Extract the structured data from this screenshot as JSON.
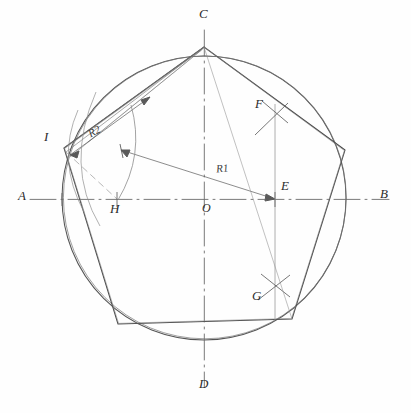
{
  "figure": {
    "kind": "geometric-construction",
    "style": "hand-drawn pencil sketch",
    "background_color": "#fefefe",
    "ink_color": "#3a3a3a",
    "construction_color": "#7a7a7a"
  },
  "canvas": {
    "width": 411,
    "height": 413
  },
  "circle": {
    "center_x": 204,
    "center_y": 198,
    "radius": 142,
    "label": "circumscribed circle"
  },
  "axes": {
    "horizontal": {
      "name": "AB",
      "y": 199,
      "x_start": 28,
      "x_end": 390,
      "style": "dash-dot centerline"
    },
    "vertical": {
      "name": "CD",
      "x": 204,
      "y_start": 28,
      "y_end": 388,
      "style": "dash-dot centerline"
    }
  },
  "points": [
    {
      "id": "A",
      "label": "A",
      "x": 62,
      "y": 199,
      "label_x": 18,
      "label_y": 190,
      "role": "left axis end"
    },
    {
      "id": "B",
      "label": "B",
      "x": 346,
      "y": 199,
      "label_x": 380,
      "label_y": 188,
      "role": "right axis end"
    },
    {
      "id": "C",
      "label": "C",
      "x": 204,
      "y": 47,
      "label_x": 199,
      "label_y": 8,
      "role": "top vertex of pentagon"
    },
    {
      "id": "D",
      "label": "D",
      "x": 204,
      "y": 347,
      "label_x": 199,
      "label_y": 378,
      "role": "bottom axis end"
    },
    {
      "id": "E",
      "label": "E",
      "x": 275,
      "y": 199,
      "label_x": 280,
      "label_y": 180,
      "role": "midpoint of OB"
    },
    {
      "id": "F",
      "label": "F",
      "x": 275,
      "y": 112,
      "label_x": 256,
      "label_y": 97,
      "role": "upper arc intersection"
    },
    {
      "id": "G",
      "label": "G",
      "x": 275,
      "y": 285,
      "label_x": 253,
      "label_y": 288,
      "role": "lower arc intersection"
    },
    {
      "id": "H",
      "label": "H",
      "x": 117,
      "y": 199,
      "label_x": 110,
      "label_y": 202,
      "role": "arc crossing on axis"
    },
    {
      "id": "I",
      "label": "I",
      "x": 64,
      "y": 148,
      "label_x": 44,
      "label_y": 131,
      "role": "upper-left vertex of pentagon"
    },
    {
      "id": "O",
      "label": "O",
      "x": 204,
      "y": 199,
      "label_x": 203,
      "label_y": 203,
      "role": "center of circle"
    }
  ],
  "dimensions": [
    {
      "id": "R1",
      "label": "R1",
      "label_x": 216,
      "label_y": 165,
      "from": "I",
      "to": "E",
      "note": "radius used for the first construction arc"
    },
    {
      "id": "R2",
      "label": "R2",
      "label_x": 88,
      "label_y": 129,
      "from": "I",
      "to": "C",
      "note": "chord length, side of the pentagon"
    }
  ],
  "pentagon": {
    "name": "inscribed pentagon",
    "vertices": [
      {
        "id": "C",
        "x": 204,
        "y": 47
      },
      {
        "id": "V2",
        "x": 345,
        "y": 150
      },
      {
        "id": "V3",
        "x": 292,
        "y": 319
      },
      {
        "id": "V4",
        "x": 118,
        "y": 324
      },
      {
        "id": "I",
        "x": 64,
        "y": 148
      }
    ]
  },
  "construction_arcs": [
    {
      "id": "arc-H",
      "note": "arc centred at I passing through H",
      "center": "I",
      "radius": 72
    },
    {
      "id": "arc-F",
      "note": "arc crossing mark at F",
      "center": "F"
    },
    {
      "id": "arc-G",
      "note": "arc crossing mark at G",
      "center": "G"
    }
  ]
}
